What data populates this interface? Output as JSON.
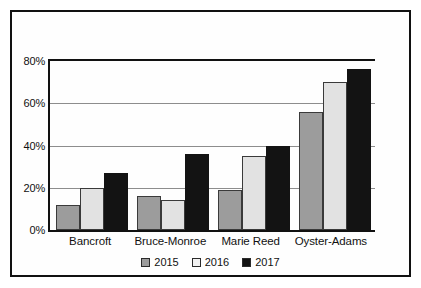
{
  "chart_data": {
    "type": "bar",
    "title": "",
    "subtitle": "",
    "xlabel": "",
    "ylabel": "",
    "categories": [
      "Bancroft",
      "Bruce-Monroe",
      "Marie Reed",
      "Oyster-Adams"
    ],
    "series": [
      {
        "name": "2015",
        "color": "#9c9c9c",
        "values": [
          12,
          16,
          19,
          56
        ]
      },
      {
        "name": "2016",
        "color": "#e2e2e2",
        "values": [
          20,
          14,
          35,
          70
        ]
      },
      {
        "name": "2017",
        "color": "#131313",
        "values": [
          27,
          36,
          40,
          76
        ]
      }
    ],
    "ylim": [
      0,
      80
    ],
    "yticks": [
      0,
      20,
      40,
      60,
      80
    ],
    "ytick_labels": [
      "0%",
      "20%",
      "40%",
      "60%",
      "80%"
    ],
    "grid": true,
    "grid_axis": "y",
    "legend_position": "bottom",
    "annotations": []
  },
  "legend": {
    "items": [
      {
        "label": "2015"
      },
      {
        "label": "2016"
      },
      {
        "label": "2017"
      }
    ]
  }
}
